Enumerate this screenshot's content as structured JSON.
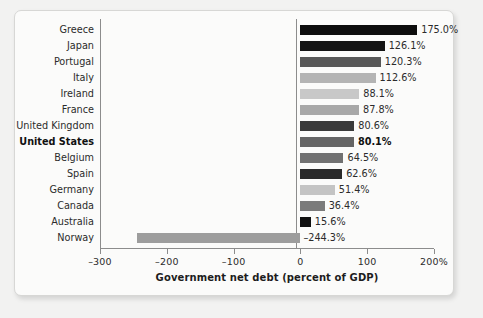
{
  "chart_data": {
    "type": "bar",
    "orientation": "horizontal",
    "title": "",
    "xlabel": "Government net debt (percent of GDP)",
    "ylabel": "",
    "xlim": [
      -300,
      200
    ],
    "xticks": [
      -300,
      -200,
      -100,
      0,
      100,
      200
    ],
    "xtick_labels": [
      "–300",
      "–200",
      "–100",
      "0",
      "100",
      "200%"
    ],
    "grid": false,
    "legend": "none",
    "highlight_category": "United States",
    "categories": [
      "Greece",
      "Japan",
      "Portugal",
      "Italy",
      "Ireland",
      "France",
      "United Kingdom",
      "United States",
      "Belgium",
      "Spain",
      "Germany",
      "Canada",
      "Australia",
      "Norway"
    ],
    "values": [
      175.0,
      126.1,
      120.3,
      112.6,
      88.1,
      87.8,
      80.6,
      80.1,
      64.5,
      62.6,
      51.4,
      36.4,
      15.6,
      -244.3
    ],
    "value_labels": [
      "175.0%",
      "126.1%",
      "120.3%",
      "112.6%",
      "88.1%",
      "87.8%",
      "80.6%",
      "80.1%",
      "64.5%",
      "62.6%",
      "51.4%",
      "36.4%",
      "15.6%",
      "–244.3%"
    ],
    "bar_colors": [
      "#0d0d0d",
      "#141414",
      "#585858",
      "#b4b4b4",
      "#c8c8c8",
      "#a8a8a8",
      "#3a3a3a",
      "#656565",
      "#717171",
      "#2a2a2a",
      "#c4c4c4",
      "#7b7b7b",
      "#111111",
      "#9d9d9d"
    ]
  },
  "axis": {
    "xlabel": "Government net debt (percent of GDP)"
  }
}
